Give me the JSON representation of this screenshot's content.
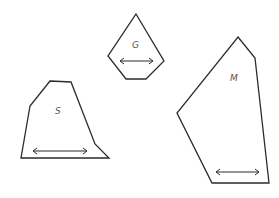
{
  "diagram": {
    "shapes": [
      {
        "id": "G",
        "label": "G",
        "points": "136,14 164,61 146,79 126,79 108,56",
        "label_pos": [
          135,
          48
        ],
        "arrow": {
          "x1": 120,
          "x2": 153,
          "y": 61
        }
      },
      {
        "id": "S",
        "label": "S",
        "points": "50,81 71,82 95,144 109,158 21,158 30,106",
        "label_pos": [
          58,
          114
        ],
        "arrow": {
          "x1": 33,
          "x2": 87,
          "y": 151
        }
      },
      {
        "id": "M",
        "label": "M",
        "points": "238,37 255,58 269,183 212,183 177,113",
        "label_pos": [
          234,
          81
        ],
        "arrow": {
          "x1": 216,
          "x2": 259,
          "y": 172
        }
      }
    ],
    "colors": {
      "stroke": "#2b2b2b",
      "label": "#555555",
      "background": "#ffffff"
    }
  }
}
